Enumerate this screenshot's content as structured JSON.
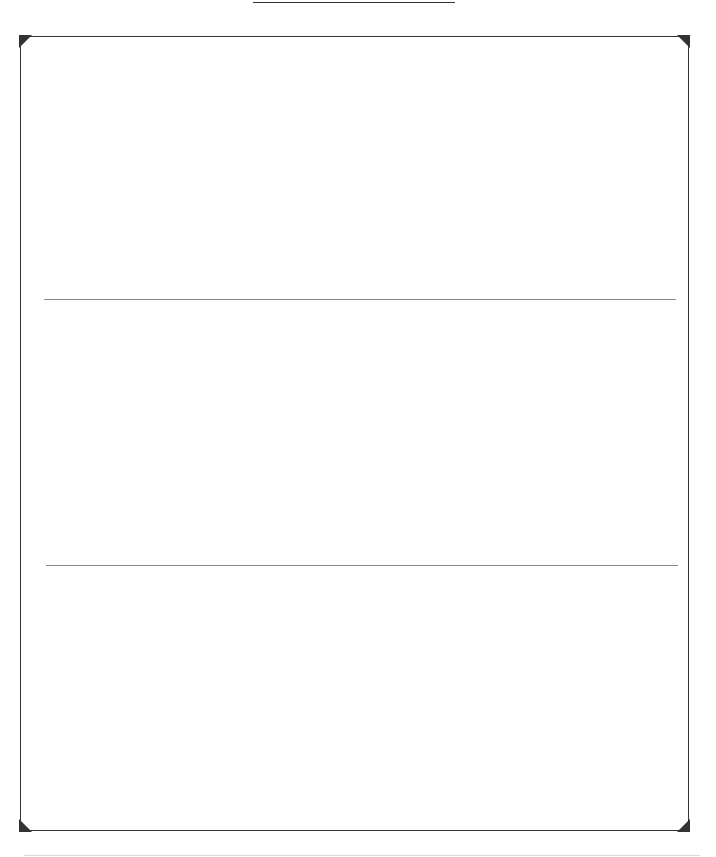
{
  "document": {
    "type": "blank-card-template",
    "panels": [
      {
        "label": ""
      },
      {
        "label": ""
      },
      {
        "label": ""
      }
    ]
  },
  "colors": {
    "frame": "#333333",
    "divider": "#8a8a8a",
    "background": "#ffffff"
  }
}
